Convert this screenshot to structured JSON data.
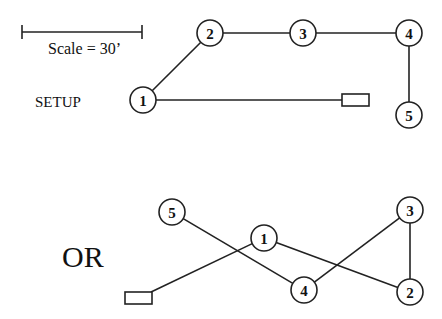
{
  "scale": {
    "label": "Scale = 30’",
    "bar": {
      "x1": 22,
      "x2": 142,
      "y": 32
    }
  },
  "setup": {
    "label": "SETUP",
    "nodes": [
      {
        "id": "1",
        "x": 143,
        "y": 100
      },
      {
        "id": "2",
        "x": 210,
        "y": 33
      },
      {
        "id": "3",
        "x": 303,
        "y": 33
      },
      {
        "id": "4",
        "x": 409,
        "y": 33
      },
      {
        "id": "5",
        "x": 409,
        "y": 115
      }
    ],
    "box": {
      "x": 342,
      "y": 94,
      "w": 27,
      "h": 12
    },
    "edges": [
      [
        "1",
        "2"
      ],
      [
        "2",
        "3"
      ],
      [
        "3",
        "4"
      ],
      [
        "4",
        "5"
      ],
      [
        "1",
        "box"
      ]
    ]
  },
  "alternative": {
    "label": "OR",
    "nodes": [
      {
        "id": "5",
        "x": 172,
        "y": 212
      },
      {
        "id": "1",
        "x": 264,
        "y": 238
      },
      {
        "id": "4",
        "x": 304,
        "y": 290
      },
      {
        "id": "3",
        "x": 410,
        "y": 210
      },
      {
        "id": "2",
        "x": 410,
        "y": 292
      }
    ],
    "box": {
      "x": 125,
      "y": 292,
      "w": 27,
      "h": 12
    },
    "edges": [
      [
        "box",
        "1"
      ],
      [
        "1",
        "2"
      ],
      [
        "2",
        "3"
      ],
      [
        "3",
        "4"
      ],
      [
        "4",
        "5"
      ]
    ]
  }
}
